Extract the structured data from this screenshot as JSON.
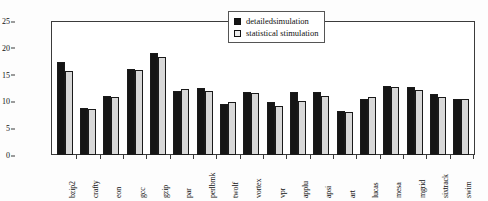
{
  "chart_data": {
    "type": "bar",
    "title": "",
    "xlabel": "",
    "ylabel": "EPC(Watt/cycle)",
    "ylim": [
      0,
      25
    ],
    "yticks": [
      0,
      5,
      10,
      15,
      20,
      25
    ],
    "grid": false,
    "legend_position": "top-right",
    "categories": [
      "bzip2",
      "crafty",
      "eon",
      "gcc",
      "gzip",
      "par",
      "perlbmk",
      "twolf",
      "vortex",
      "vpr",
      "applu",
      "apsi",
      "art",
      "lucas",
      "mesa",
      "mgrid",
      "sixtrack",
      "swim"
    ],
    "series": [
      {
        "name": "detailedsimulation",
        "color": "#151515",
        "values": [
          17.4,
          8.8,
          11.1,
          16.1,
          19.1,
          11.9,
          12.5,
          9.6,
          11.7,
          9.9,
          11.7,
          11.7,
          8.3,
          10.5,
          12.8,
          12.6,
          11.4,
          10.4
        ]
      },
      {
        "name": "statistical stimulation",
        "color": "#d8d8d8",
        "values": [
          15.7,
          8.5,
          10.9,
          15.8,
          18.3,
          12.3,
          11.9,
          9.9,
          11.5,
          9.1,
          10.1,
          11.0,
          8.1,
          10.9,
          12.7,
          12.2,
          10.8,
          10.4
        ]
      }
    ]
  },
  "legend": {
    "items": [
      {
        "label": "detailedsimulation",
        "marker": "filled-square-marker"
      },
      {
        "label": "statistical stimulation",
        "marker": "open-square-marker"
      }
    ]
  }
}
